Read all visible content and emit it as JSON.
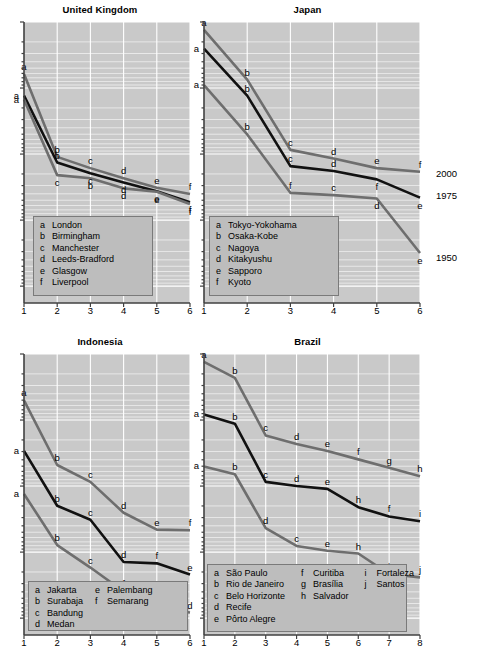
{
  "figure": {
    "right_axis_labels": [
      "2000",
      "1975",
      "1950"
    ]
  },
  "chart_data": [
    {
      "type": "line",
      "title": "United Kingdom",
      "xlabel": "",
      "ylabel": "",
      "xticks": [
        "1",
        "2",
        "3",
        "4",
        "5",
        "6"
      ],
      "xlim": [
        1,
        6
      ],
      "yscale": "log",
      "grid": true,
      "legend_position": "bottom-left",
      "legend": [
        {
          "key": "a",
          "name": "London"
        },
        {
          "key": "b",
          "name": "Birmingham"
        },
        {
          "key": "c",
          "name": "Manchester"
        },
        {
          "key": "d",
          "name": "Leeds-Bradford"
        },
        {
          "key": "e",
          "name": "Glasgow"
        },
        {
          "key": "f",
          "name": "Liverpool"
        }
      ],
      "series": [
        {
          "name": "2000",
          "color": "#6e6e6e",
          "x": [
            1,
            2,
            3,
            4,
            5,
            6
          ],
          "yfrac": [
            0.185,
            0.48,
            0.52,
            0.556,
            0.59,
            0.612
          ],
          "labels": [
            "a",
            "b",
            "c",
            "d",
            "e",
            "f"
          ],
          "label_side": [
            "above",
            "above",
            "above",
            "above",
            "above",
            "above"
          ]
        },
        {
          "name": "1975",
          "color": "#111111",
          "x": [
            1,
            2,
            3,
            4,
            5,
            6
          ],
          "yfrac": [
            0.262,
            0.5,
            0.538,
            0.571,
            0.602,
            0.641
          ],
          "labels": [
            "a",
            "b",
            "c",
            "d",
            "e",
            "f"
          ],
          "label_side": [
            "left",
            "above",
            "below",
            "below",
            "below",
            "below"
          ]
        },
        {
          "name": "1950",
          "color": "#6e6e6e",
          "x": [
            1,
            2,
            3,
            4,
            5,
            6
          ],
          "yfrac": [
            0.276,
            0.545,
            0.556,
            0.592,
            0.604,
            0.648
          ],
          "labels": [
            "a",
            "c",
            "b",
            "d",
            "e",
            "f"
          ],
          "label_side": [
            "left",
            "below",
            "below",
            "below",
            "below",
            "below"
          ]
        }
      ]
    },
    {
      "type": "line",
      "title": "Japan",
      "xlabel": "",
      "ylabel": "",
      "xticks": [
        "1",
        "2",
        "3",
        "4",
        "5",
        "6"
      ],
      "xlim": [
        1,
        6
      ],
      "yscale": "log",
      "grid": true,
      "legend_position": "bottom-left",
      "legend": [
        {
          "key": "a",
          "name": "Tokyo-Yokohama"
        },
        {
          "key": "b",
          "name": "Osaka-Kobe"
        },
        {
          "key": "c",
          "name": "Nagoya"
        },
        {
          "key": "d",
          "name": "Kitakyushu"
        },
        {
          "key": "e",
          "name": "Sapporo"
        },
        {
          "key": "f",
          "name": "Kyoto"
        }
      ],
      "series": [
        {
          "name": "2000",
          "color": "#6e6e6e",
          "x": [
            1,
            2,
            3,
            4,
            5,
            6
          ],
          "yfrac": [
            0.028,
            0.205,
            0.455,
            0.486,
            0.52,
            0.533
          ],
          "labels": [
            "a",
            "b",
            "c",
            "d",
            "e",
            "f"
          ],
          "label_side": [
            "above",
            "above",
            "above",
            "above",
            "above",
            "above"
          ]
        },
        {
          "name": "1975",
          "color": "#111111",
          "x": [
            1,
            2,
            3,
            4,
            5,
            6
          ],
          "yfrac": [
            0.095,
            0.262,
            0.513,
            0.53,
            0.56,
            0.625
          ],
          "labels": [
            "a",
            "b",
            "c",
            "d",
            "f",
            "e"
          ],
          "label_side": [
            "left",
            "above",
            "above",
            "above",
            "below",
            "below"
          ]
        },
        {
          "name": "1950",
          "color": "#6e6e6e",
          "x": [
            1,
            2,
            3,
            4,
            5,
            6
          ],
          "yfrac": [
            0.225,
            0.4,
            0.608,
            0.616,
            0.628,
            0.822
          ],
          "labels": [
            "a",
            "b",
            "f",
            "c",
            "d",
            "e"
          ],
          "label_side": [
            "left",
            "above",
            "above",
            "above",
            "below",
            "below"
          ]
        }
      ]
    },
    {
      "type": "line",
      "title": "Indonesia",
      "xlabel": "",
      "ylabel": "",
      "xticks": [
        "1",
        "2",
        "3",
        "4",
        "5",
        "6"
      ],
      "xlim": [
        1,
        6
      ],
      "yscale": "log",
      "grid": true,
      "legend_position": "bottom-left",
      "legend": [
        {
          "key": "a",
          "name": "Jakarta"
        },
        {
          "key": "b",
          "name": "Surabaja"
        },
        {
          "key": "c",
          "name": "Bandung"
        },
        {
          "key": "d",
          "name": "Medan"
        },
        {
          "key": "e",
          "name": "Palembang"
        },
        {
          "key": "f",
          "name": "Semarang"
        }
      ],
      "series": [
        {
          "name": "2000",
          "color": "#6e6e6e",
          "x": [
            1,
            2,
            3,
            4,
            5,
            6
          ],
          "yfrac": [
            0.165,
            0.395,
            0.455,
            0.565,
            0.625,
            0.627
          ],
          "labels": [
            "a",
            "b",
            "c",
            "d",
            "e",
            "f"
          ],
          "label_side": [
            "above",
            "above",
            "above",
            "above",
            "above",
            "above"
          ]
        },
        {
          "name": "1975",
          "color": "#111111",
          "x": [
            1,
            2,
            3,
            4,
            5,
            6
          ],
          "yfrac": [
            0.345,
            0.54,
            0.59,
            0.74,
            0.745,
            0.785
          ],
          "labels": [
            "a",
            "b",
            "c",
            "d",
            "f",
            "e"
          ],
          "label_side": [
            "left",
            "above",
            "above",
            "above",
            "above",
            "above"
          ]
        },
        {
          "name": "1950",
          "color": "#6e6e6e",
          "x": [
            1,
            2,
            3,
            4,
            5,
            6
          ],
          "yfrac": [
            0.498,
            0.68,
            0.76,
            0.845,
            0.905,
            0.92
          ],
          "labels": [
            "a",
            "b",
            "c",
            "f",
            "e",
            "d"
          ],
          "label_side": [
            "left",
            "above",
            "above",
            "above",
            "above",
            "above"
          ]
        }
      ]
    },
    {
      "type": "line",
      "title": "Brazil",
      "xlabel": "",
      "ylabel": "",
      "xticks": [
        "1",
        "2",
        "3",
        "4",
        "5",
        "6",
        "7",
        "8"
      ],
      "xlim": [
        1,
        8
      ],
      "yscale": "log",
      "grid": true,
      "legend_position": "bottom-left",
      "legend": [
        {
          "key": "a",
          "name": "São Paulo"
        },
        {
          "key": "b",
          "name": "Rio de Janeiro"
        },
        {
          "key": "c",
          "name": "Belo Horizonte"
        },
        {
          "key": "d",
          "name": "Recife"
        },
        {
          "key": "e",
          "name": "Pôrto Alegre"
        },
        {
          "key": "f",
          "name": "Curitiba"
        },
        {
          "key": "g",
          "name": "Brasília"
        },
        {
          "key": "h",
          "name": "Salvador"
        },
        {
          "key": "i",
          "name": "Fortaleza"
        },
        {
          "key": "j",
          "name": "Santos"
        }
      ],
      "series": [
        {
          "name": "2000",
          "color": "#6e6e6e",
          "x": [
            1,
            2,
            3,
            4,
            5,
            6,
            7,
            8
          ],
          "yfrac": [
            0.028,
            0.085,
            0.29,
            0.32,
            0.345,
            0.375,
            0.405,
            0.435
          ],
          "labels": [
            "a",
            "b",
            "c",
            "d",
            "e",
            "f",
            "g",
            "h"
          ],
          "label_side": [
            "above",
            "above",
            "above",
            "above",
            "above",
            "above",
            "above",
            "above"
          ]
        },
        {
          "name": "1975",
          "color": "#111111",
          "x": [
            1,
            2,
            3,
            4,
            5,
            6,
            7,
            8
          ],
          "yfrac": [
            0.215,
            0.248,
            0.455,
            0.47,
            0.48,
            0.545,
            0.578,
            0.595
          ],
          "labels": [
            "a",
            "b",
            "c",
            "d",
            "e",
            "h",
            "f",
            "i"
          ],
          "label_side": [
            "left",
            "above",
            "above",
            "above",
            "above",
            "above",
            "above",
            "above"
          ]
        },
        {
          "name": "1950",
          "color": "#6e6e6e",
          "x": [
            1,
            2,
            3,
            4,
            5,
            6,
            7,
            8
          ],
          "yfrac": [
            0.4,
            0.428,
            0.62,
            0.683,
            0.7,
            0.71,
            0.783,
            0.795
          ],
          "labels": [
            "a",
            "b",
            "d",
            "c",
            "e",
            "h",
            "i",
            "j"
          ],
          "label_side": [
            "left",
            "above",
            "above",
            "above",
            "above",
            "above",
            "above",
            "above"
          ]
        }
      ]
    }
  ]
}
